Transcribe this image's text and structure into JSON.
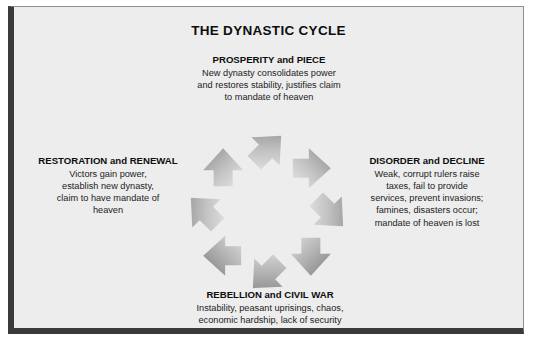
{
  "diagram": {
    "title": "THE DYNASTIC CYCLE",
    "stages": [
      {
        "id": "prosperity",
        "heading": "PROSPERITY and PIECE",
        "lines": [
          "New dynasty consolidates power",
          "and restores stability, justifies claim",
          "to mandate of heaven"
        ]
      },
      {
        "id": "disorder",
        "heading": "DISORDER and DECLINE",
        "lines": [
          "Weak, corrupt rulers raise",
          "taxes, fail to provide",
          "services, prevent invasions;",
          "famines, disasters occur;",
          "mandate of heaven is lost"
        ]
      },
      {
        "id": "rebellion",
        "heading": "REBELLION and CIVIL WAR",
        "lines": [
          "Instability, peasant uprisings, chaos,",
          "economic hardship, lack of security"
        ]
      },
      {
        "id": "restoration",
        "heading": "RESTORATION and RENEWAL",
        "lines": [
          "Victors gain power,",
          "establish new dynasty,",
          "claim to have mandate of",
          "heaven"
        ]
      }
    ],
    "cycle": {
      "direction": "clockwise",
      "arrow_count": 8,
      "arrow_dark_color": "#8d8d8d",
      "arrow_light_color": "#e2e2e2"
    },
    "colors": {
      "background": "#ededed",
      "frame_shadow": "#3a3a3a",
      "frame_hairline": "#8f8f8f",
      "title_color": "#0d0d0d",
      "text_color": "#222222"
    }
  }
}
